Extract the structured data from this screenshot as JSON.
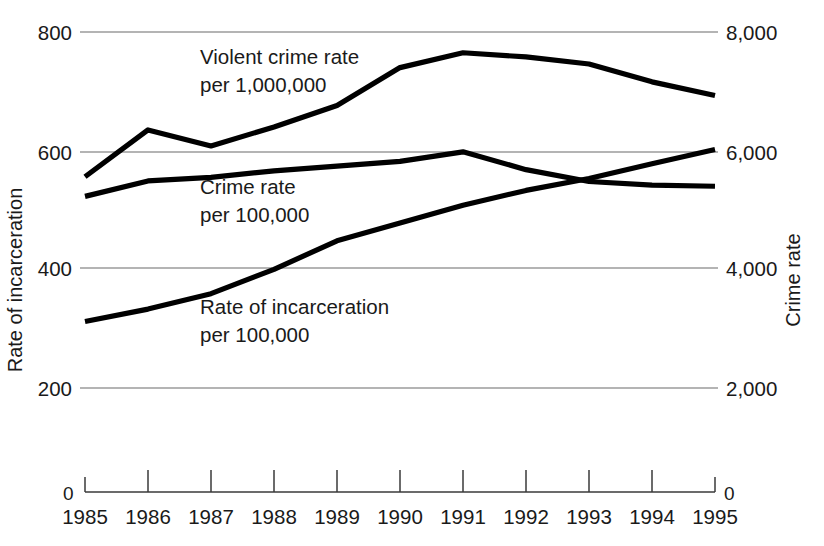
{
  "chart_data": {
    "type": "line",
    "title": "",
    "subtitle": "",
    "xlabel": "",
    "ylabel": "Rate of incarceration",
    "y2label": "Crime rate",
    "grid": true,
    "legend_position": "inline-annotations",
    "x": [
      1985,
      1986,
      1987,
      1988,
      1989,
      1990,
      1991,
      1992,
      1993,
      1994,
      1995
    ],
    "categories": [
      "1985",
      "1986",
      "1987",
      "1988",
      "1989",
      "1990",
      "1991",
      "1992",
      "1993",
      "1994",
      "1995"
    ],
    "ylim": [
      0,
      800
    ],
    "yticks": [
      200,
      400,
      600,
      800
    ],
    "ytick_labels": [
      "200",
      "400",
      "600",
      "800"
    ],
    "y2lim": [
      0,
      8000
    ],
    "y2ticks": [
      2000,
      4000,
      6000,
      8000
    ],
    "y2tick_labels": [
      "2,000",
      "4,000",
      "6,000",
      "8,000"
    ],
    "x_axis_origin_label_left": "0",
    "x_axis_origin_label_right": "0",
    "series": [
      {
        "name": "Violent crime rate per 1,000,000",
        "label_line1": "Violent crime rate",
        "label_line2": "per 1,000,000",
        "axis": "left",
        "color": "#000000",
        "values": [
          556,
          635,
          608,
          640,
          676,
          740,
          765,
          758,
          746,
          716,
          693
        ]
      },
      {
        "name": "Crime rate per 100,000",
        "label_line1": "Crime rate",
        "label_line2": "per 100,000",
        "axis": "right",
        "color": "#000000",
        "values": [
          5230,
          5490,
          5550,
          5660,
          5740,
          5820,
          5980,
          5680,
          5480,
          5420,
          5400
        ]
      },
      {
        "name": "Rate of incarceration per 100,000",
        "label_line1": "Rate of incarceration",
        "label_line2": "per 100,000",
        "axis": "left",
        "color": "#000000",
        "values": [
          312,
          333,
          359,
          400,
          448,
          478,
          508,
          533,
          553,
          578,
          602
        ]
      }
    ],
    "annotations": [
      {
        "text": "Violent crime rate",
        "x_px": 200,
        "y_px": 64
      },
      {
        "text": "per 1,000,000",
        "x_px": 200,
        "y_px": 92
      },
      {
        "text": "Crime rate",
        "x_px": 200,
        "y_px": 194
      },
      {
        "text": "per 100,000",
        "x_px": 200,
        "y_px": 222
      },
      {
        "text": "Rate of incarceration",
        "x_px": 200,
        "y_px": 314
      },
      {
        "text": "per 100,000",
        "x_px": 200,
        "y_px": 342
      }
    ]
  }
}
